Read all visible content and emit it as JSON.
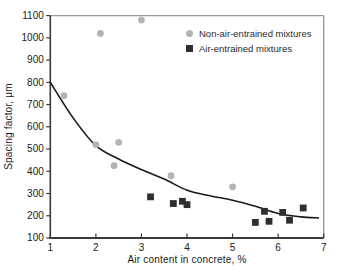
{
  "figure": {
    "background": "#ffffff"
  },
  "chart_data": {
    "type": "scatter",
    "title": "",
    "xlabel": "Air content in concrete, %",
    "ylabel": "Spacing factor, μm",
    "xlim": [
      1,
      7
    ],
    "ylim": [
      100,
      1100
    ],
    "x_ticks": [
      1,
      2,
      3,
      4,
      5,
      6,
      7
    ],
    "y_ticks": [
      100,
      200,
      300,
      400,
      500,
      600,
      700,
      800,
      900,
      1000,
      1100
    ],
    "grid": false,
    "legend_position": "upper-right",
    "axis_colors": {
      "left_bottom": "#3a3a3a",
      "top_right": "#9a9a9a",
      "tick_label": "#1a1a1a"
    },
    "series": [
      {
        "name": "Non-air-entrained mixtures",
        "marker": "circle",
        "color": "#b4b4b4",
        "points": [
          [
            1.3,
            740
          ],
          [
            2.0,
            520
          ],
          [
            2.1,
            1020
          ],
          [
            2.4,
            425
          ],
          [
            2.5,
            530
          ],
          [
            3.0,
            1080
          ],
          [
            3.65,
            380
          ],
          [
            5.0,
            330
          ]
        ]
      },
      {
        "name": "Air-entrained mixtures",
        "marker": "square",
        "color": "#2e2e2e",
        "points": [
          [
            3.2,
            285
          ],
          [
            3.7,
            255
          ],
          [
            3.9,
            265
          ],
          [
            4.0,
            250
          ],
          [
            5.5,
            170
          ],
          [
            5.7,
            220
          ],
          [
            5.8,
            175
          ],
          [
            6.1,
            215
          ],
          [
            6.25,
            180
          ],
          [
            6.55,
            235
          ]
        ]
      }
    ],
    "trend_curve": {
      "color": "#1a1a1a",
      "points": [
        [
          1.0,
          800
        ],
        [
          1.5,
          640
        ],
        [
          2.0,
          515
        ],
        [
          2.5,
          455
        ],
        [
          3.0,
          408
        ],
        [
          3.5,
          365
        ],
        [
          4.0,
          315
        ],
        [
          4.5,
          290
        ],
        [
          5.0,
          270
        ],
        [
          5.5,
          243
        ],
        [
          6.0,
          210
        ],
        [
          6.5,
          195
        ],
        [
          6.9,
          190
        ]
      ]
    }
  }
}
